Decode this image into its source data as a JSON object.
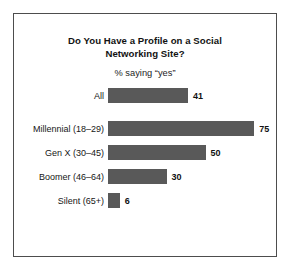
{
  "chart_data": {
    "type": "bar",
    "orientation": "horizontal",
    "title": "Do You Have a Profile on a Social Networking Site?",
    "title_line_1": "Do You Have a Profile on a Social",
    "title_line_2": "Networking Site?",
    "subtitle": "% saying “yes”",
    "xlabel": "",
    "ylabel": "",
    "xlim": [
      0,
      100
    ],
    "grid": false,
    "legend": false,
    "value_suffix": "",
    "categories": [
      "All",
      "Millennial (18–29)",
      "Gen X (30–45)",
      "Boomer (46–64)",
      "Silent (65+)"
    ],
    "values": [
      41,
      75,
      50,
      30,
      6
    ],
    "bars": [
      {
        "label": "All",
        "value": 41,
        "value_text": "41",
        "separated": true
      },
      {
        "label": "Millennial (18–29)",
        "value": 75,
        "value_text": "75",
        "separated": false
      },
      {
        "label": "Gen X (30–45)",
        "value": 50,
        "value_text": "50",
        "separated": false
      },
      {
        "label": "Boomer (46–64)",
        "value": 30,
        "value_text": "30",
        "separated": false
      },
      {
        "label": "Silent (65+)",
        "value": 6,
        "value_text": "6",
        "separated": false
      }
    ],
    "colors": {
      "bar_fill": "#595959",
      "frame_border": "#4d4d4d",
      "background": "#ffffff",
      "text": "#161616"
    }
  }
}
